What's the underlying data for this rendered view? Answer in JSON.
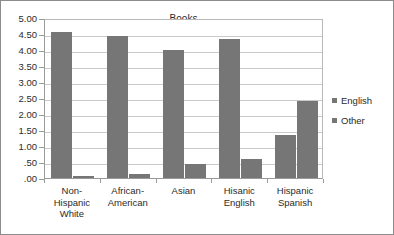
{
  "chart_data": {
    "type": "bar",
    "title": "Books",
    "xlabel": "",
    "ylabel": "",
    "ylim": [
      0,
      5
    ],
    "ytick_step": 0.5,
    "ytick_labels": [
      "5.00",
      "4.50",
      "4.00",
      "3.50",
      "3.00",
      "2.50",
      "2.00",
      "1.50",
      "1.00",
      ".50",
      ".00"
    ],
    "ytick_values": [
      5,
      4.5,
      4,
      3.5,
      3,
      2.5,
      2,
      1.5,
      1,
      0.5,
      0
    ],
    "grid": true,
    "legend_position": "right",
    "categories": [
      "Non-\nHispanic\nWhite",
      "African-\nAmerican",
      "Asian",
      "Hisanic\nEnglish",
      "Hispanic\nSpanish"
    ],
    "series": [
      {
        "name": "English",
        "values": [
          4.55,
          4.45,
          4.0,
          4.35,
          1.35
        ],
        "color": "#767676"
      },
      {
        "name": "Other",
        "values": [
          0.05,
          0.13,
          0.45,
          0.6,
          2.4
        ],
        "color": "#767676"
      }
    ]
  },
  "legend": {
    "items": [
      {
        "label": "English"
      },
      {
        "label": "Other"
      }
    ]
  },
  "colors": {
    "bar": "#767676",
    "gridline": "#c9c9c9",
    "axis": "#9a9a9a",
    "frame": "#8c8c8c",
    "text": "#2b2b2b"
  }
}
